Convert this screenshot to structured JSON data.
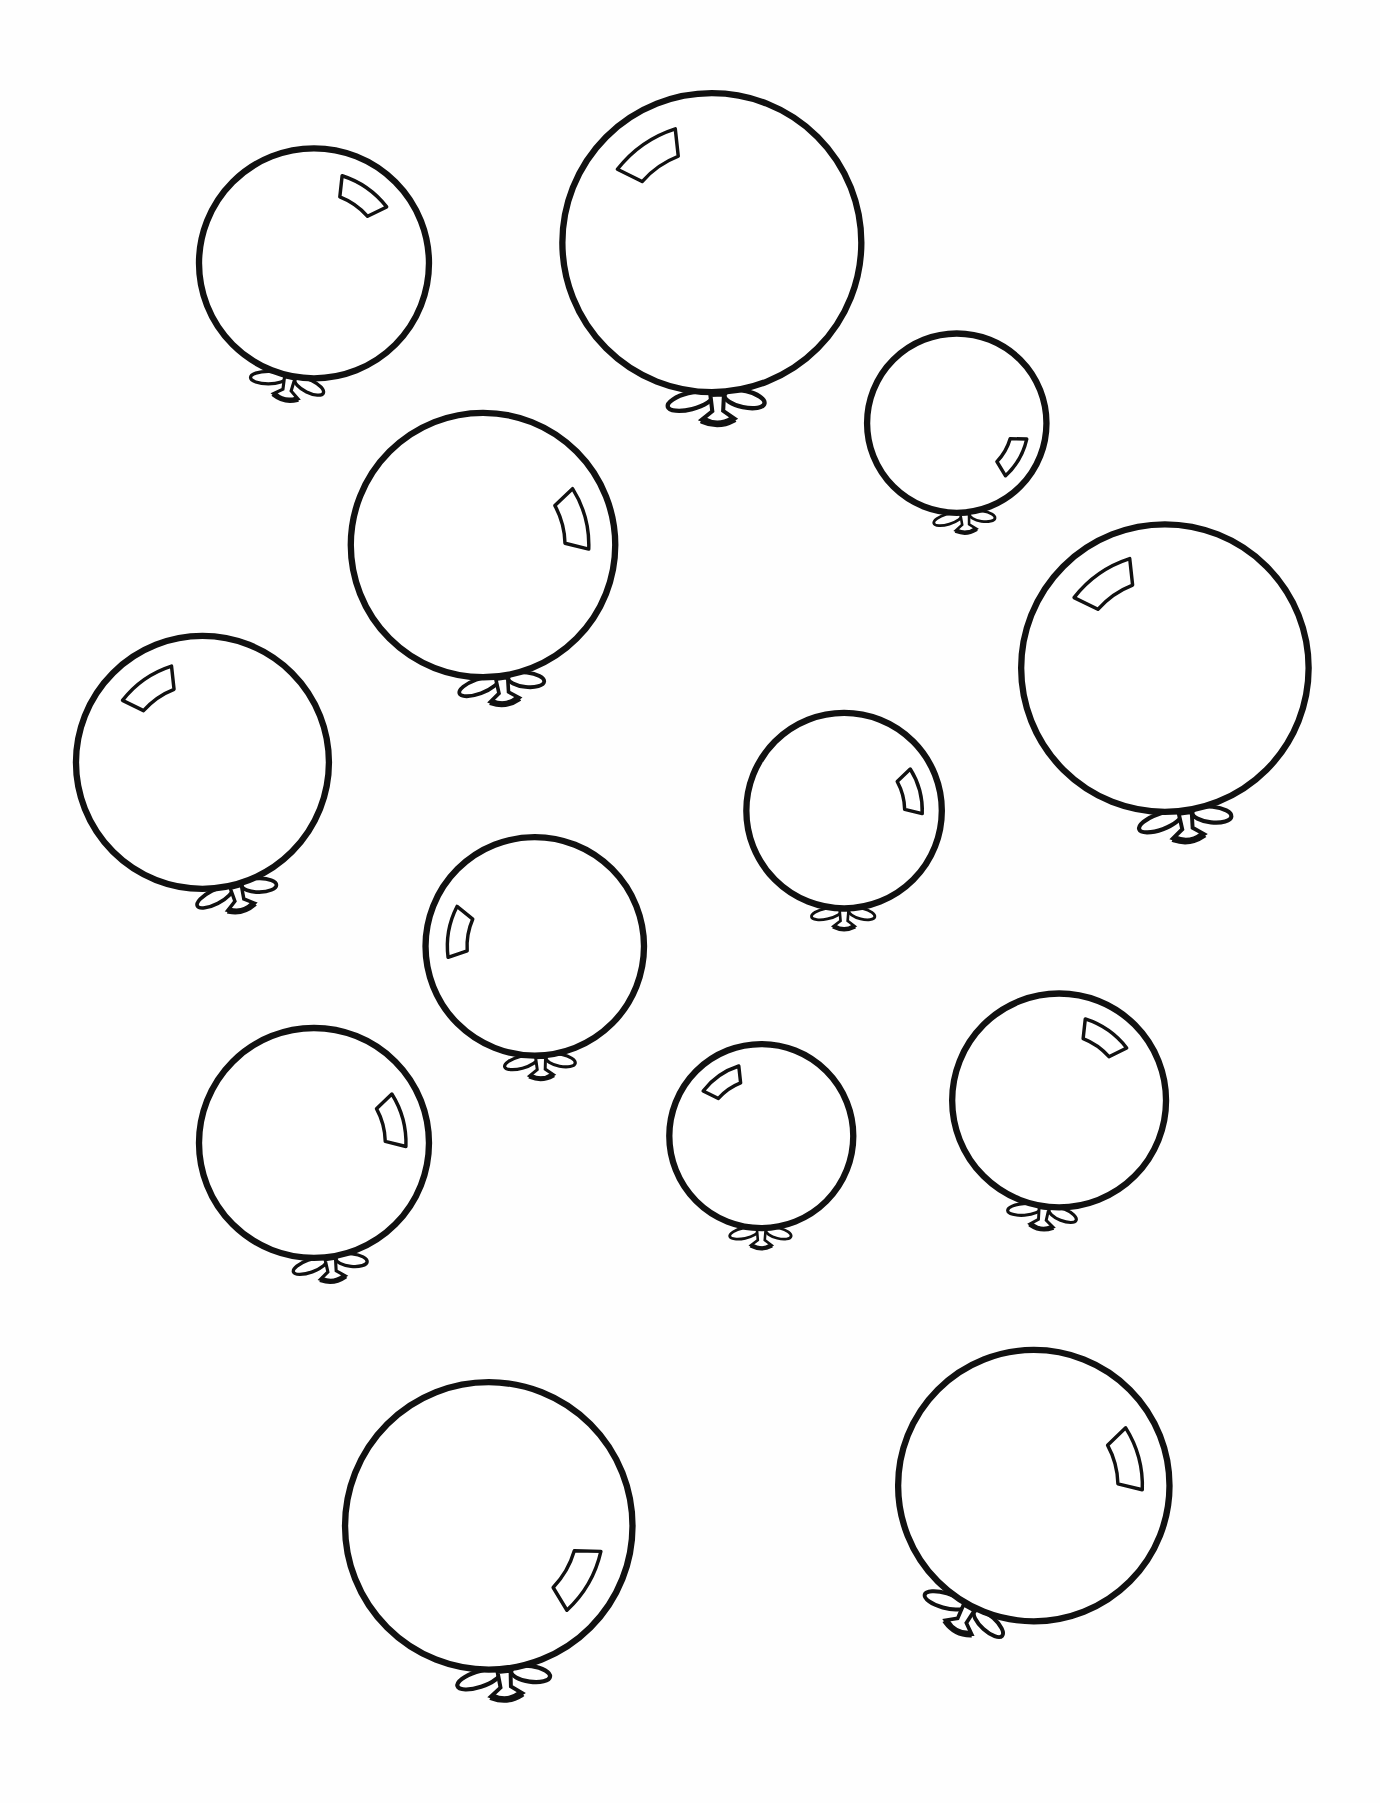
{
  "page": {
    "kind": "coloring-sheet",
    "background_color": "#ffffff",
    "line_color": "#111111",
    "balloon_count": 13
  },
  "balloons": [
    {
      "id": 1,
      "cx": 273,
      "cy": 229,
      "r": 100,
      "shine": "top-right",
      "knot_angle": 12
    },
    {
      "id": 2,
      "cx": 619,
      "cy": 211,
      "r": 130,
      "shine": "top-left",
      "knot_angle": -2
    },
    {
      "id": 3,
      "cx": 832,
      "cy": 368,
      "r": 78,
      "shine": "bottom-right",
      "knot_angle": -5
    },
    {
      "id": 4,
      "cx": 420,
      "cy": 474,
      "r": 115,
      "shine": "right",
      "knot_angle": -8
    },
    {
      "id": 5,
      "cx": 1013,
      "cy": 581,
      "r": 125,
      "shine": "top-left",
      "knot_angle": -8
    },
    {
      "id": 6,
      "cx": 176,
      "cy": 663,
      "r": 110,
      "shine": "top-left",
      "knot_angle": -15
    },
    {
      "id": 7,
      "cx": 734,
      "cy": 705,
      "r": 85,
      "shine": "right",
      "knot_angle": 0
    },
    {
      "id": 8,
      "cx": 465,
      "cy": 823,
      "r": 95,
      "shine": "left",
      "knot_angle": -3
    },
    {
      "id": 9,
      "cx": 273,
      "cy": 994,
      "r": 100,
      "shine": "right",
      "knot_angle": -8
    },
    {
      "id": 10,
      "cx": 662,
      "cy": 988,
      "r": 80,
      "shine": "top-left",
      "knot_angle": 0
    },
    {
      "id": 11,
      "cx": 921,
      "cy": 957,
      "r": 93,
      "shine": "top-right",
      "knot_angle": 8
    },
    {
      "id": 12,
      "cx": 425,
      "cy": 1327,
      "r": 125,
      "shine": "bottom-right",
      "knot_angle": -6
    },
    {
      "id": 13,
      "cx": 899,
      "cy": 1292,
      "r": 118,
      "shine": "right",
      "knot_angle": 28
    }
  ]
}
